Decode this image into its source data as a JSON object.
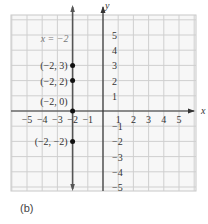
{
  "chart_data": {
    "type": "scatter",
    "title": "",
    "caption": "(b)",
    "xlabel": "x",
    "ylabel": "y",
    "xlim": [
      -6,
      6
    ],
    "ylim": [
      -5.3,
      6.4
    ],
    "grid": true,
    "x_ticks": [
      -5,
      -4,
      -3,
      -2,
      -1,
      1,
      2,
      3,
      4,
      5
    ],
    "y_ticks": [
      -5,
      -4,
      -3,
      -2,
      -1,
      1,
      2,
      3,
      4,
      5
    ],
    "x_tick_labels": [
      "−5",
      "−4",
      "−3",
      "−2",
      "−1",
      "1",
      "2",
      "3",
      "4",
      "5"
    ],
    "y_tick_labels": [
      "−5",
      "−4",
      "−3",
      "−2",
      "−1",
      "1",
      "2",
      "3",
      "4",
      "5"
    ],
    "lines": [
      {
        "type": "vertical",
        "x": -2,
        "label": "x = −2",
        "color": "#555555"
      }
    ],
    "points": [
      {
        "x": -2,
        "y": 3,
        "label": "(−2, 3)"
      },
      {
        "x": -2,
        "y": 2,
        "label": "(−2, 2)"
      },
      {
        "x": -2,
        "y": 0,
        "label": "(−2, 0)"
      },
      {
        "x": -2,
        "y": -2,
        "label": "(−2, −2)"
      }
    ]
  }
}
